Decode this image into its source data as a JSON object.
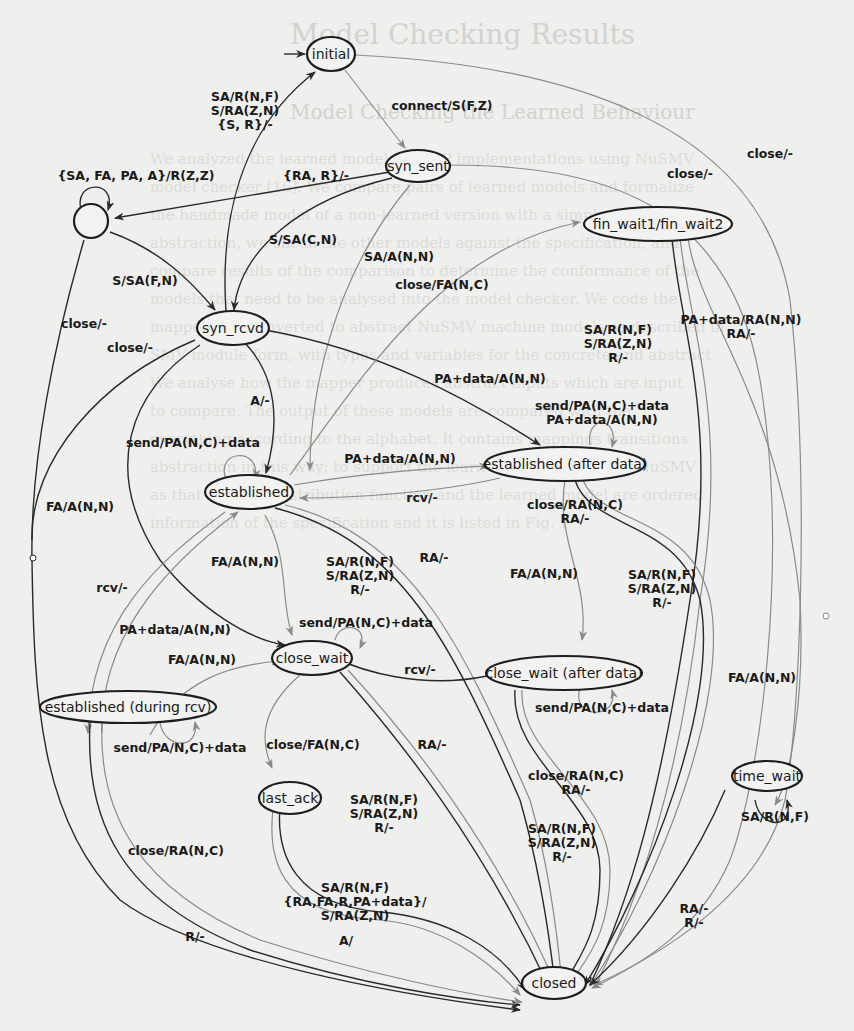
{
  "background": {
    "heading": "Model Checking Results",
    "subheading": "Model Checking the Learned Behaviour",
    "lines": [
      "We analyzed the learned models of TCP implementations using NuSMV",
      "model checker [16]. We compare pairs of learned models and formalize",
      "the handmade model of a non-learned version with a simple specification",
      "abstraction, we check the other models against the specification, and",
      "compare results of the comparison to determine the conformance of the",
      "models that need to be analysed into the model checker. We code the",
      "mapped and converted to abstract NuSMV machine models as described in",
      "SMV module form, with types and variables for the concrete and abstract",
      "We analyse how the mapper produces abstract inputs which are input",
      "to compare. The output of these models are compared with the",
      "everything according to the alphabet. It contains mappings transitions",
      "abstraction in this way; to support the learner, which is used in NuSMV",
      "as that both the distribution function and the learned model are ordered",
      "information of the specification and it is listed in Fig. 1"
    ]
  },
  "diagram": {
    "states": [
      {
        "id": "initial",
        "label": "initial"
      },
      {
        "id": "sink",
        "label": ""
      },
      {
        "id": "syn_sent",
        "label": "syn_sent"
      },
      {
        "id": "syn_rcvd",
        "label": "syn_rcvd"
      },
      {
        "id": "fin_wait",
        "label": "fin_wait1/fin_wait2"
      },
      {
        "id": "established",
        "label": "established"
      },
      {
        "id": "established_after",
        "label": "established (after data)"
      },
      {
        "id": "close_wait",
        "label": "close_wait"
      },
      {
        "id": "close_wait_after",
        "label": "close_wait (after data)"
      },
      {
        "id": "established_rcv",
        "label": "established (during rcv)"
      },
      {
        "id": "last_ack",
        "label": "last_ack"
      },
      {
        "id": "time_wait",
        "label": "time_wait"
      },
      {
        "id": "closed",
        "label": "closed"
      }
    ],
    "edge_labels": {
      "initial_to_syn_sent": "connect/S(F,Z)",
      "initial_to_closed": "close/-",
      "syn_rcvd_to_initial_1": "SA/R(N,F)",
      "syn_rcvd_to_initial_2": "S/RA(Z,N)",
      "syn_rcvd_to_initial_3": "{S, R}/-",
      "sink_self": "{SA, FA, PA, A}/R(Z,Z)",
      "syn_sent_to_sink": "{RA, R}/-",
      "syn_sent_to_syn_rcvd": "S/SA(C,N)",
      "syn_sent_to_established": "SA/A(N,N)",
      "syn_sent_to_closed": "close/-",
      "sink_to_syn_rcvd": "S/SA(F,N)",
      "sink_to_closed": "close/-",
      "syn_rcvd_to_closed": "close/-",
      "syn_rcvd_to_established": "A/-",
      "syn_rcvd_to_established_after": "PA+data/A(N,N)",
      "established_to_fin_wait": "close/FA(N,C)",
      "fin_wait_to_closed_1": "SA/R(N,F)",
      "fin_wait_to_closed_2": "S/RA(Z,N)",
      "fin_wait_to_closed_3": "R/-",
      "fin_wait_to_time_wait_1": "PA+data/RA(N,N)",
      "fin_wait_to_time_wait_2": "RA/-",
      "established_after_self_1": "send/PA(N,C)+data",
      "established_after_self_2": "PA+data/A(N,N)",
      "established_self": "send/PA(N,C)+data",
      "established_to_established_after": "PA+data/A(N,N)",
      "established_after_to_established": "rcv/-",
      "syn_rcvd_to_close_wait": "FA/A(N,N)",
      "established_to_close_wait": "FA/A(N,N)",
      "established_to_closed_1": "SA/R(N,F)",
      "established_to_closed_2": "S/RA(Z,N)",
      "established_to_closed_3": "R/-",
      "established_to_closed_ra": "RA/-",
      "established_after_to_closed_1": "close/RA(N,C)",
      "established_after_to_closed_2": "RA/-",
      "established_after_to_close_wait_after": "FA/A(N,N)",
      "established_after_to_closed_3": "SA/R(N,F)",
      "established_after_to_closed_4": "S/RA(Z,N)",
      "established_after_to_closed_5": "R/-",
      "established_to_established_rcv": "rcv/-",
      "established_rcv_to_established": "PA+data/A(N,N)",
      "established_rcv_to_close_wait": "FA/A(N,N)",
      "close_wait_self": "send/PA(N,C)+data",
      "close_wait_after_to_close_wait": "rcv/-",
      "established_rcv_self": "send/PA/N,C)+data",
      "close_wait_to_last_ack": "close/FA(N,C)",
      "close_wait_to_closed": "RA/-",
      "close_wait_to_closed_1": "SA/R(N,F)",
      "close_wait_to_closed_2": "S/RA(Z,N)",
      "close_wait_to_closed_3": "R/-",
      "close_wait_after_self": "send/PA(N,C)+data",
      "close_wait_after_to_closed_1": "close/RA(N,C)",
      "close_wait_after_to_closed_2": "RA/-",
      "close_wait_after_to_closed_3": "SA/R(N,F)",
      "close_wait_after_to_closed_4": "S/RA(Z,N)",
      "close_wait_after_to_closed_5": "R/-",
      "fin_wait_to_time_wait_fa": "FA/A(N,N)",
      "time_wait_self": "SA/R(N,F)",
      "established_rcv_to_closed": "close/RA(N,C)",
      "established_rcv_to_closed_r": "R/-",
      "last_ack_to_closed_1": "SA/R(N,F)",
      "last_ack_to_closed_2": "{RA,FA,R,PA+data}/",
      "last_ack_to_closed_3": "S/RA(Z,N)",
      "last_ack_to_closed_4": "A/",
      "time_wait_to_closed_1": "RA/-",
      "time_wait_to_closed_2": "R/-"
    }
  }
}
